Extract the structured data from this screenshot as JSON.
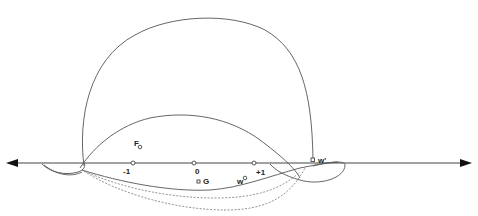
{
  "diagram": {
    "type": "complex-plane contour diagram",
    "axis": {
      "orientation": "horizontal",
      "arrows": "both ends"
    },
    "axis_points": [
      {
        "id": "minus-one",
        "label": "-1"
      },
      {
        "id": "zero",
        "label": "0"
      },
      {
        "id": "plus-one",
        "label": "+1"
      }
    ],
    "labeled_points": [
      {
        "id": "F",
        "label": "F"
      },
      {
        "id": "G",
        "label": "G"
      },
      {
        "id": "w",
        "label": "w"
      },
      {
        "id": "w-prime",
        "label": "w'"
      }
    ],
    "curves": [
      {
        "id": "outer-arc",
        "style": "solid",
        "description": "large upper loop"
      },
      {
        "id": "inner-arc",
        "style": "solid",
        "description": "smaller upper loop"
      },
      {
        "id": "lower-solid",
        "style": "solid",
        "description": "lower arc through w"
      },
      {
        "id": "lower-dashed-1",
        "style": "dashed"
      },
      {
        "id": "lower-dashed-2",
        "style": "dashed"
      },
      {
        "id": "right-loop",
        "style": "solid",
        "description": "loop near w'"
      },
      {
        "id": "left-loop",
        "style": "solid",
        "description": "loop at left end"
      }
    ]
  }
}
